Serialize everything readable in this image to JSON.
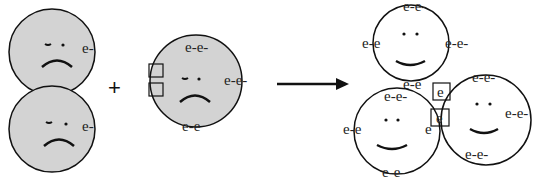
{
  "diagram": {
    "type": "chemical-bonding-analogy",
    "colors": {
      "reactant_fill": "#d3d3d3",
      "product_fill": "#ffffff",
      "stroke": "#111111"
    },
    "operator": "+",
    "reactants": [
      {
        "id": "atom-1",
        "mood": "sad",
        "electrons_right": "e-"
      },
      {
        "id": "atom-2",
        "mood": "sad",
        "electrons_right": "e-"
      },
      {
        "id": "atom-3",
        "mood": "sad",
        "electrons_top": "e-e-",
        "electrons_right": "e-e-",
        "electrons_bottom": "e-e",
        "empty_slots": 2
      }
    ],
    "products": [
      {
        "id": "product-top",
        "mood": "happy",
        "electrons_top": "e-e-",
        "electrons_left": "e-e",
        "electrons_right": "e-e-",
        "electrons_bottom": "e-e"
      },
      {
        "id": "product-bottom-left",
        "mood": "happy",
        "electrons_top": "e-e-",
        "electrons_left": "e-e",
        "electrons_right": "e",
        "electrons_bottom": "e-e-"
      },
      {
        "id": "product-right",
        "mood": "happy",
        "electrons_top": "e-e-",
        "electrons_right": "e-e-",
        "electrons_bottom": "e-e-",
        "shared_slot_1": "e",
        "shared_slot_2": "e"
      }
    ]
  }
}
